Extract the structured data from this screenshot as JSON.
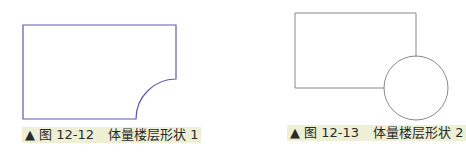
{
  "figures": [
    {
      "id": "fig-12-12",
      "shape": "rectangle-with-concave-quarter-circle-corner",
      "caption": {
        "marker": "▲",
        "number": "图 12-12",
        "title": "体量楼层形状 1"
      },
      "stroke_color": "#5a5ab0"
    },
    {
      "id": "fig-12-13",
      "shape": "rectangle-with-circle-at-corner",
      "caption": {
        "marker": "▲",
        "number": "图 12-13",
        "title": "体量楼层形状 2"
      },
      "stroke_color": "#888888"
    }
  ],
  "caption_bg": "#eef0d6"
}
